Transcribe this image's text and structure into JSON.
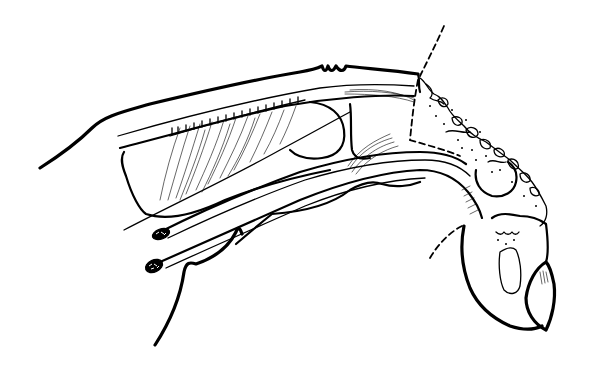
{
  "figure": {
    "type": "anatomical line drawing",
    "background": "#ffffff",
    "ink": "#000000",
    "labels": []
  }
}
